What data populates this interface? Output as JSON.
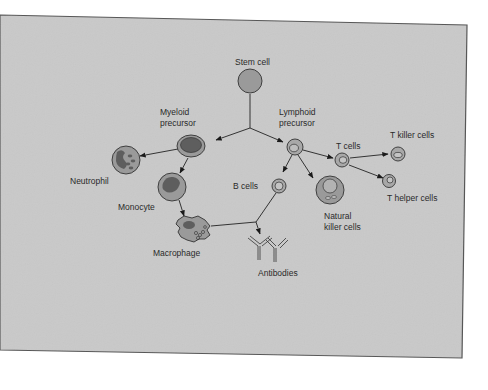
{
  "diagram": {
    "type": "cell-lineage-flow",
    "colors": {
      "panel_bg": "#c9c9c9",
      "panel_border": "#555555",
      "cell_fill": "#9a9a9a",
      "nucleus_fill": "#6e6e6e",
      "line": "#222222"
    },
    "nodes": [
      {
        "id": "stem",
        "label": "Stem cell"
      },
      {
        "id": "myeloid",
        "label_line1": "Myeloid",
        "label_line2": "precursor"
      },
      {
        "id": "lymphoid",
        "label_line1": "Lymphoid",
        "label_line2": "precursor"
      },
      {
        "id": "neutrophil",
        "label": "Neutrophil"
      },
      {
        "id": "monocyte",
        "label": "Monocyte"
      },
      {
        "id": "macrophage",
        "label": "Macrophage"
      },
      {
        "id": "bcells",
        "label": "B cells"
      },
      {
        "id": "antibodies",
        "label": "Antibodies"
      },
      {
        "id": "nk",
        "label_line1": "Natural",
        "label_line2": "killer cells"
      },
      {
        "id": "tcells",
        "label": "T cells"
      },
      {
        "id": "tkiller",
        "label": "T killer cells"
      },
      {
        "id": "thelper",
        "label": "T helper cells"
      }
    ],
    "edges": [
      [
        "stem",
        "myeloid"
      ],
      [
        "stem",
        "lymphoid"
      ],
      [
        "myeloid",
        "neutrophil"
      ],
      [
        "myeloid",
        "monocyte"
      ],
      [
        "monocyte",
        "macrophage"
      ],
      [
        "lymphoid",
        "bcells"
      ],
      [
        "lymphoid",
        "nk"
      ],
      [
        "lymphoid",
        "tcells"
      ],
      [
        "tcells",
        "tkiller"
      ],
      [
        "tcells",
        "thelper"
      ],
      [
        "bcells",
        "antibodies"
      ],
      [
        "macrophage",
        "antibodies"
      ]
    ]
  }
}
